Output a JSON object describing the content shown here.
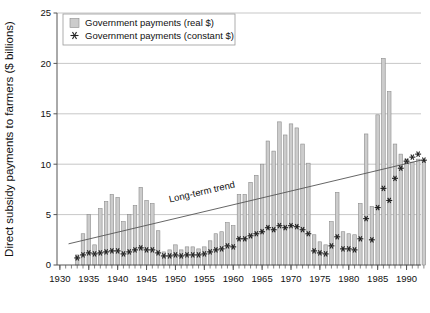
{
  "chart_data": {
    "type": "bar",
    "title": "",
    "subtitle": "",
    "xlabel": "",
    "ylabel": "Direct subsidy payments to farmers ($ billions)",
    "ylim": [
      0,
      25
    ],
    "xlim": [
      1930,
      1993
    ],
    "yticks": [
      0,
      5,
      10,
      15,
      20,
      25
    ],
    "ytick_labels": [
      "0",
      "5",
      "10",
      "15",
      "20",
      "25"
    ],
    "xticks": [
      1930,
      1935,
      1940,
      1945,
      1950,
      1955,
      1960,
      1965,
      1970,
      1975,
      1980,
      1985,
      1990
    ],
    "xtick_labels": [
      "1930",
      "1935",
      "1940",
      "1945",
      "1950",
      "1955",
      "1960",
      "1965",
      "1970",
      "1975",
      "1980",
      "1985",
      "1990"
    ],
    "grid": true,
    "grid_axis": "y",
    "legend_position": "top-left",
    "legend": [
      {
        "label": "Government payments (real $)",
        "marker": "bar-swatch",
        "color": "#cccccc"
      },
      {
        "label": "Government payments (constant $)",
        "marker": "star",
        "color": "#222222"
      }
    ],
    "annotations": [
      {
        "text": "Long-term trend",
        "x": 1949.5,
        "y": 6.2,
        "rotation": -13
      }
    ],
    "trendline": {
      "x": [
        1932,
        1993
      ],
      "y": [
        2.1,
        10.4
      ]
    },
    "x": [
      1933,
      1934,
      1935,
      1936,
      1937,
      1938,
      1939,
      1940,
      1941,
      1942,
      1943,
      1944,
      1945,
      1946,
      1947,
      1948,
      1949,
      1950,
      1951,
      1952,
      1953,
      1954,
      1955,
      1956,
      1957,
      1958,
      1959,
      1960,
      1961,
      1962,
      1963,
      1964,
      1965,
      1966,
      1967,
      1968,
      1969,
      1970,
      1971,
      1972,
      1973,
      1974,
      1975,
      1976,
      1977,
      1978,
      1979,
      1980,
      1981,
      1982,
      1983,
      1984,
      1985,
      1986,
      1987,
      1988,
      1989,
      1990,
      1991,
      1992,
      1993
    ],
    "series": [
      {
        "name": "Government payments (real $)",
        "type": "bar",
        "color": "#cccccc",
        "values": [
          1.0,
          3.1,
          5.0,
          2.0,
          5.6,
          6.3,
          7.0,
          6.7,
          4.3,
          5.0,
          5.9,
          7.7,
          6.4,
          6.1,
          3.4,
          1.3,
          1.5,
          2.0,
          1.5,
          1.8,
          1.8,
          1.6,
          1.8,
          2.4,
          3.1,
          3.3,
          4.2,
          3.9,
          7.0,
          7.0,
          8.2,
          8.9,
          10.0,
          12.3,
          11.3,
          14.2,
          12.9,
          14.0,
          13.6,
          12.0,
          10.1,
          3.0,
          2.3,
          2.0,
          4.3,
          7.2,
          3.3,
          3.1,
          3.0,
          6.1,
          13.0,
          5.8,
          14.9,
          20.5,
          17.2,
          12.0,
          11.0,
          10.5,
          10.2,
          10.5,
          10.4
        ]
      },
      {
        "name": "Government payments (constant $)",
        "type": "line-markers",
        "marker": "star",
        "color": "#222222",
        "values": [
          0.7,
          1.0,
          1.2,
          1.1,
          1.2,
          1.3,
          1.4,
          1.4,
          1.1,
          1.3,
          1.5,
          1.7,
          1.5,
          1.5,
          1.2,
          0.9,
          0.9,
          1.0,
          0.9,
          1.0,
          1.0,
          1.0,
          1.1,
          1.3,
          1.5,
          1.6,
          1.9,
          1.8,
          2.6,
          2.6,
          2.9,
          3.1,
          3.3,
          3.7,
          3.5,
          3.9,
          3.7,
          3.9,
          3.8,
          3.5,
          3.1,
          1.4,
          1.2,
          1.1,
          1.9,
          2.8,
          1.6,
          1.6,
          1.5,
          2.6,
          4.6,
          2.5,
          5.7,
          7.6,
          6.4,
          8.6,
          9.6,
          10.3,
          10.7,
          11.0,
          10.4
        ]
      }
    ]
  },
  "style": {
    "bar_fill": "#cccccc",
    "bar_stroke": "#8c8c8c",
    "marker_color": "#222222",
    "grid_color": "#b9b9b9",
    "axis_color": "#555555",
    "trend_color": "#555555",
    "background": "#ffffff"
  }
}
